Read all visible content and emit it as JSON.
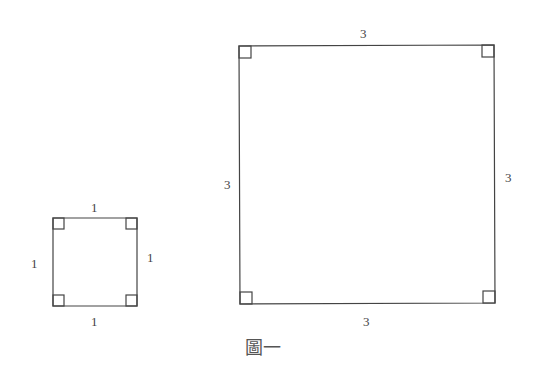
{
  "diagram": {
    "caption": "圖一",
    "small_square": {
      "side_length": 1,
      "labels": {
        "top": "1",
        "left": "1",
        "right": "1",
        "bottom": "1"
      },
      "right_angle_markers": 4
    },
    "large_square": {
      "side_length": 3,
      "labels": {
        "top": "3",
        "left": "3",
        "right": "3",
        "bottom": "3"
      },
      "right_angle_markers": 4
    },
    "colors": {
      "stroke": "#444444",
      "background": "#ffffff"
    }
  }
}
